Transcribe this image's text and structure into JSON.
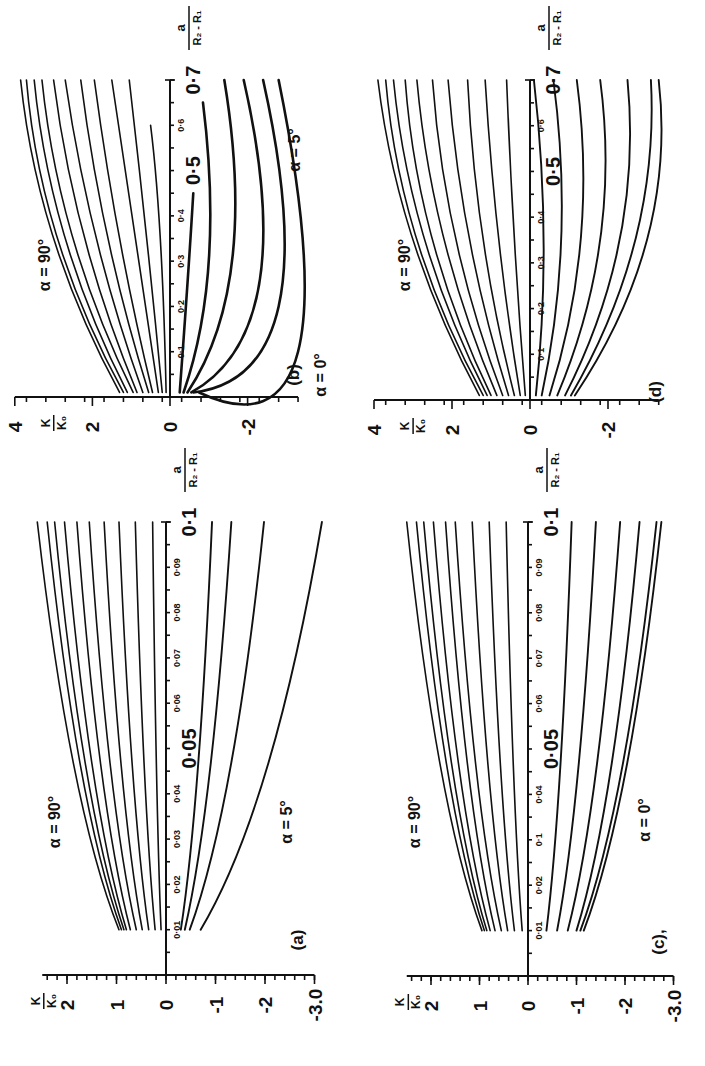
{
  "figure": {
    "orientation": "rotated-90-ccw",
    "ink_color": "#111111",
    "background": "#ffffff"
  },
  "chart_data": [
    {
      "panel": "(b)",
      "type": "line",
      "title": "",
      "xlabel": "a / (R2 - R1)",
      "ylabel": "K / K0",
      "xlim": [
        0,
        0.7
      ],
      "ylim": [
        -3.3,
        4
      ],
      "x_ticks": [
        "0.1",
        "0.2",
        "0.3",
        "0.4",
        "0.5",
        "0.6",
        "0.7"
      ],
      "y_ticks": [
        "4",
        "2",
        "0",
        "-2"
      ],
      "annotations": [
        "α = 90°",
        "α = 5°"
      ],
      "series_note": "Family of curves from α = 90° (top) to α = 5° (bottom)",
      "series": [
        {
          "name": "α=90°",
          "x": [
            0.01,
            0.35,
            0.7
          ],
          "y": [
            1.3,
            3.0,
            3.85
          ]
        },
        {
          "name": "c2",
          "x": [
            0.01,
            0.35,
            0.7
          ],
          "y": [
            1.2,
            2.9,
            3.7
          ]
        },
        {
          "name": "c3",
          "x": [
            0.01,
            0.35,
            0.7
          ],
          "y": [
            1.1,
            2.7,
            3.5
          ]
        },
        {
          "name": "c4",
          "x": [
            0.01,
            0.35,
            0.7
          ],
          "y": [
            0.95,
            2.5,
            3.3
          ]
        },
        {
          "name": "c5",
          "x": [
            0.01,
            0.35,
            0.7
          ],
          "y": [
            0.85,
            2.2,
            3.0
          ]
        },
        {
          "name": "c6",
          "x": [
            0.01,
            0.35,
            0.7
          ],
          "y": [
            0.7,
            1.9,
            2.7
          ]
        },
        {
          "name": "c7",
          "x": [
            0.01,
            0.35,
            0.7
          ],
          "y": [
            0.55,
            1.6,
            2.3
          ]
        },
        {
          "name": "c8",
          "x": [
            0.01,
            0.35,
            0.7
          ],
          "y": [
            0.45,
            1.3,
            1.95
          ]
        },
        {
          "name": "c9",
          "x": [
            0.01,
            0.35,
            0.7
          ],
          "y": [
            0.3,
            0.9,
            1.5
          ]
        },
        {
          "name": "c10",
          "x": [
            0.01,
            0.35,
            0.7
          ],
          "y": [
            0.2,
            0.6,
            1.05
          ]
        },
        {
          "name": "c11",
          "x": [
            0.01,
            0.35,
            0.6
          ],
          "y": [
            0.1,
            0.25,
            0.5
          ]
        },
        {
          "name": "c12",
          "x": [
            0.01,
            0.25,
            0.45
          ],
          "y": [
            -0.25,
            -0.45,
            -0.6
          ]
        },
        {
          "name": "c13",
          "x": [
            0.01,
            0.3,
            0.65
          ],
          "y": [
            -0.35,
            -1.0,
            -0.85
          ]
        },
        {
          "name": "c14",
          "x": [
            0.01,
            0.3,
            0.7
          ],
          "y": [
            -0.45,
            -1.6,
            -1.4
          ]
        },
        {
          "name": "c15",
          "x": [
            0.01,
            0.25,
            0.7
          ],
          "y": [
            -0.55,
            -2.3,
            -1.9
          ]
        },
        {
          "name": "c16",
          "x": [
            0.01,
            0.2,
            0.7
          ],
          "y": [
            -0.6,
            -2.8,
            -2.4
          ]
        },
        {
          "name": "α=5°",
          "x": [
            0.01,
            0.1,
            0.7
          ],
          "y": [
            -0.75,
            -3.3,
            -2.8
          ]
        }
      ]
    },
    {
      "panel": "(a)",
      "type": "line",
      "title": "",
      "xlabel": "a / (R2 - R1)",
      "ylabel": "K / K0",
      "xlim": [
        0,
        0.1
      ],
      "ylim": [
        -3.0,
        2.5
      ],
      "x_ticks": [
        "0.01",
        "0.02",
        "0.03",
        "0.04",
        "0.05",
        "0.06",
        "0.07",
        "0.08",
        "0.09",
        "0.1"
      ],
      "y_ticks": [
        "2",
        "1",
        "0",
        "-1",
        "-2",
        "-3.0"
      ],
      "annotations": [
        "α = 90°",
        "α = 5°"
      ],
      "series_note": "Family of curves from α = 90° (top) to α = 5° (bottom)",
      "series": [
        {
          "name": "α=90°",
          "x": [
            0.01,
            0.1
          ],
          "y": [
            0.95,
            2.6
          ]
        },
        {
          "name": "c2",
          "x": [
            0.01,
            0.1
          ],
          "y": [
            0.9,
            2.4
          ]
        },
        {
          "name": "c3",
          "x": [
            0.01,
            0.1
          ],
          "y": [
            0.85,
            2.25
          ]
        },
        {
          "name": "c4",
          "x": [
            0.01,
            0.1
          ],
          "y": [
            0.8,
            2.05
          ]
        },
        {
          "name": "c5",
          "x": [
            0.01,
            0.1
          ],
          "y": [
            0.72,
            1.8
          ]
        },
        {
          "name": "c6",
          "x": [
            0.01,
            0.1
          ],
          "y": [
            0.6,
            1.55
          ]
        },
        {
          "name": "c7",
          "x": [
            0.01,
            0.1
          ],
          "y": [
            0.48,
            1.25
          ]
        },
        {
          "name": "c8",
          "x": [
            0.01,
            0.1
          ],
          "y": [
            0.35,
            0.95
          ]
        },
        {
          "name": "c9",
          "x": [
            0.01,
            0.1
          ],
          "y": [
            0.22,
            0.62
          ]
        },
        {
          "name": "c10",
          "x": [
            0.01,
            0.1
          ],
          "y": [
            0.1,
            0.27
          ]
        },
        {
          "name": "c11",
          "x": [
            0.01,
            0.1
          ],
          "y": [
            -0.3,
            -0.93
          ]
        },
        {
          "name": "c12",
          "x": [
            0.01,
            0.1
          ],
          "y": [
            -0.38,
            -1.32
          ]
        },
        {
          "name": "c13",
          "x": [
            0.01,
            0.1
          ],
          "y": [
            -0.48,
            -1.98
          ]
        },
        {
          "name": "α=5°",
          "x": [
            0.01,
            0.1
          ],
          "y": [
            -0.7,
            -3.15
          ]
        }
      ]
    },
    {
      "panel": "(d)",
      "type": "line",
      "title": "",
      "xlabel": "a / (R2 - R1)",
      "ylabel": "K / K0",
      "xlim": [
        0,
        0.7
      ],
      "ylim": [
        -3.3,
        4
      ],
      "x_ticks": [
        "0.1",
        "0.2",
        "0.3",
        "0.4",
        "0.5",
        "0.6",
        "0.7"
      ],
      "y_ticks": [
        "4",
        "2",
        "0",
        "-2"
      ],
      "annotations": [
        "α = 90°",
        "α = 0°"
      ],
      "series_note": "Family of curves from α = 90° (top) to α = 0° (bottom), symmetric about K/K0 = 0",
      "series": [
        {
          "name": "α=90°",
          "x": [
            0.01,
            0.35,
            0.7
          ],
          "y": [
            1.3,
            3.0,
            3.9
          ]
        },
        {
          "name": "c2",
          "x": [
            0.01,
            0.35,
            0.7
          ],
          "y": [
            1.2,
            2.9,
            3.7
          ]
        },
        {
          "name": "c3",
          "x": [
            0.01,
            0.35,
            0.7
          ],
          "y": [
            1.1,
            2.7,
            3.5
          ]
        },
        {
          "name": "c4",
          "x": [
            0.01,
            0.35,
            0.7
          ],
          "y": [
            1.0,
            2.5,
            3.2
          ]
        },
        {
          "name": "c5",
          "x": [
            0.01,
            0.35,
            0.7
          ],
          "y": [
            0.85,
            2.2,
            2.9
          ]
        },
        {
          "name": "c6",
          "x": [
            0.01,
            0.35,
            0.7
          ],
          "y": [
            0.7,
            1.9,
            2.5
          ]
        },
        {
          "name": "c7",
          "x": [
            0.01,
            0.35,
            0.7
          ],
          "y": [
            0.55,
            1.55,
            2.1
          ]
        },
        {
          "name": "c8",
          "x": [
            0.01,
            0.35,
            0.7
          ],
          "y": [
            0.4,
            1.2,
            1.6
          ]
        },
        {
          "name": "c9",
          "x": [
            0.01,
            0.35,
            0.7
          ],
          "y": [
            0.25,
            0.8,
            1.15
          ]
        },
        {
          "name": "c10",
          "x": [
            0.01,
            0.35,
            0.7
          ],
          "y": [
            0.12,
            0.4,
            0.6
          ]
        },
        {
          "name": "c11",
          "x": [
            0.01,
            0.35,
            0.7
          ],
          "y": [
            -0.15,
            -0.35,
            -0.1
          ]
        },
        {
          "name": "c12",
          "x": [
            0.01,
            0.35,
            0.7
          ],
          "y": [
            -0.3,
            -0.8,
            -0.6
          ]
        },
        {
          "name": "c13",
          "x": [
            0.01,
            0.35,
            0.7
          ],
          "y": [
            -0.5,
            -1.3,
            -1.2
          ]
        },
        {
          "name": "c14",
          "x": [
            0.01,
            0.35,
            0.7
          ],
          "y": [
            -0.7,
            -1.8,
            -1.8
          ]
        },
        {
          "name": "c15",
          "x": [
            0.01,
            0.35,
            0.7
          ],
          "y": [
            -0.9,
            -2.3,
            -2.5
          ]
        },
        {
          "name": "c16",
          "x": [
            0.01,
            0.35,
            0.7
          ],
          "y": [
            -1.05,
            -2.7,
            -3.1
          ]
        },
        {
          "name": "α=0°",
          "x": [
            0.01,
            0.35,
            0.7
          ],
          "y": [
            -1.15,
            -3.0,
            -3.3
          ]
        }
      ]
    },
    {
      "panel": "(c)",
      "type": "line",
      "title": "",
      "xlabel": "a / (R2 - R1)",
      "ylabel": "K / K0",
      "xlim": [
        0,
        0.1
      ],
      "ylim": [
        -3.0,
        2.5
      ],
      "x_ticks": [
        "0.01",
        "0.02",
        "0.03",
        "0.04",
        "0.05",
        "0.06",
        "0.07",
        "0.08",
        "0.09",
        "0.1"
      ],
      "y_ticks": [
        "2",
        "1",
        "0",
        "-1",
        "-2",
        "-3.0"
      ],
      "annotations": [
        "α = 90°",
        "α = 0°"
      ],
      "series_note": "Family of curves from α = 90° (top) to α = 0° (bottom)",
      "series": [
        {
          "name": "α=90°",
          "x": [
            0.01,
            0.1
          ],
          "y": [
            0.95,
            2.5
          ]
        },
        {
          "name": "c2",
          "x": [
            0.01,
            0.1
          ],
          "y": [
            0.9,
            2.3
          ]
        },
        {
          "name": "c3",
          "x": [
            0.01,
            0.1
          ],
          "y": [
            0.85,
            2.15
          ]
        },
        {
          "name": "c4",
          "x": [
            0.01,
            0.1
          ],
          "y": [
            0.78,
            1.95
          ]
        },
        {
          "name": "c5",
          "x": [
            0.01,
            0.1
          ],
          "y": [
            0.68,
            1.7
          ]
        },
        {
          "name": "c6",
          "x": [
            0.01,
            0.1
          ],
          "y": [
            0.55,
            1.5
          ]
        },
        {
          "name": "c7",
          "x": [
            0.01,
            0.1
          ],
          "y": [
            0.42,
            1.15
          ]
        },
        {
          "name": "c8",
          "x": [
            0.01,
            0.1
          ],
          "y": [
            0.28,
            0.8
          ]
        },
        {
          "name": "c9",
          "x": [
            0.01,
            0.1
          ],
          "y": [
            0.12,
            0.45
          ]
        },
        {
          "name": "c10",
          "x": [
            0.01,
            0.1
          ],
          "y": [
            -0.38,
            -0.9
          ]
        },
        {
          "name": "c11",
          "x": [
            0.01,
            0.1
          ],
          "y": [
            -0.6,
            -1.4
          ]
        },
        {
          "name": "c12",
          "x": [
            0.01,
            0.1
          ],
          "y": [
            -0.82,
            -1.9
          ]
        },
        {
          "name": "c13",
          "x": [
            0.01,
            0.1
          ],
          "y": [
            -1.0,
            -2.3
          ]
        },
        {
          "name": "c14",
          "x": [
            0.01,
            0.1
          ],
          "y": [
            -1.08,
            -2.65
          ]
        },
        {
          "name": "α=0°",
          "x": [
            0.01,
            0.1
          ],
          "y": [
            -1.15,
            -2.75
          ]
        }
      ]
    }
  ],
  "panels": {
    "b": {
      "label": "(b)",
      "alpha_top": "α = 90°",
      "alpha_bottom": "α = 5°",
      "x_label_num": "a",
      "x_label_den": "R₂ - R₁",
      "y_label_num": "K",
      "y_label_den": "K₀",
      "x_big_ticks": [
        "0.5",
        "0.7"
      ],
      "x_small_ticks": [
        "0.1",
        "0.2",
        "0.3",
        "0.4",
        "0.6"
      ],
      "y_ticks": [
        "4",
        "2",
        "0",
        "-2"
      ]
    },
    "a": {
      "label": "(a)",
      "alpha_top": "α = 90°",
      "alpha_bottom": "α = 5°",
      "x_label_num": "a",
      "x_label_den": "R₂ - R₁",
      "y_label_num": "K",
      "y_label_den": "K₀",
      "x_big_ticks": [
        "0.05",
        "0.1"
      ],
      "x_small_ticks": [
        "0.01",
        "0.02",
        "0.03",
        "0.04",
        "0.06",
        "0.07",
        "0.08",
        "0.09"
      ],
      "y_ticks": [
        "2",
        "1",
        "0",
        "-1",
        "-2",
        "-3.0"
      ]
    },
    "d": {
      "label": "(d)",
      "alpha_top": "α = 90°",
      "alpha_bottom": "α = 0°",
      "x_label_num": "a",
      "x_label_den": "R₂ - R₁",
      "y_label_num": "K",
      "y_label_den": "K₀",
      "x_big_ticks": [
        "0.5",
        "0.7"
      ],
      "x_small_ticks": [
        "0.1",
        "0.2",
        "0.3",
        "0.4",
        "0.6"
      ],
      "y_ticks": [
        "4",
        "2",
        "0",
        "-2"
      ]
    },
    "c": {
      "label": "(c),",
      "alpha_top": "α = 90°",
      "alpha_bottom": "α = 0°",
      "x_label_num": "a",
      "x_label_den": "R₂ - R₁",
      "y_label_num": "K",
      "y_label_den": "K₀",
      "x_big_ticks": [
        "0.05",
        "0.1"
      ],
      "x_small_ticks": [
        "0.01",
        "0.02",
        "0.1",
        "0.04",
        "0.06",
        "0.07",
        "0.08",
        "0.09"
      ],
      "y_ticks": [
        "2",
        "1",
        "0",
        "-1",
        "-2",
        "-3.0"
      ]
    }
  }
}
